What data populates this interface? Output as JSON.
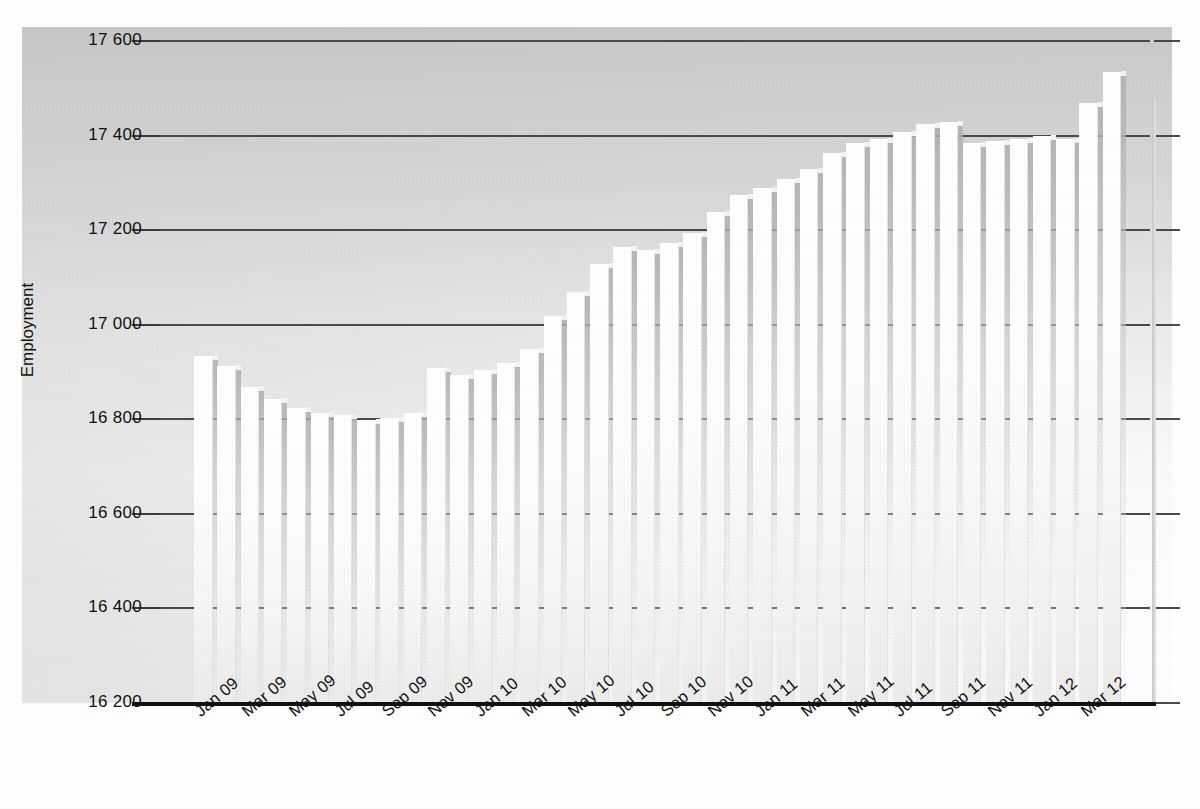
{
  "chart_data": {
    "type": "bar",
    "title": "",
    "subtitle": "",
    "xlabel": "",
    "ylabel": "Employment",
    "ylim": [
      16200,
      17600
    ],
    "ytick_step": 200,
    "ytick_labels": [
      "17 600",
      "17 400",
      "17 200",
      "17 000",
      "16 800",
      "16 600",
      "16 400",
      "16 200"
    ],
    "ytick_values": [
      17600,
      17400,
      17200,
      17000,
      16800,
      16600,
      16400,
      16200
    ],
    "grid": "horizontal",
    "legend": "none",
    "x_tick_labels": [
      "Jan 09",
      "Mar 09",
      "May 09",
      "Jul 09",
      "Sep 09",
      "Nov 09",
      "Jan 10",
      "Mar 10",
      "May 10",
      "Jul 10",
      "Sep 10",
      "Nov 10",
      "Jan 11",
      "Mar 11",
      "May 11",
      "Jul 11",
      "Sep 11",
      "Nov 11",
      "Jan 12",
      "Mar 12"
    ],
    "categories": [
      "Jan 09",
      "Feb 09",
      "Mar 09",
      "Apr 09",
      "May 09",
      "Jun 09",
      "Jul 09",
      "Aug 09",
      "Sep 09",
      "Oct 09",
      "Nov 09",
      "Dec 09",
      "Jan 10",
      "Feb 10",
      "Mar 10",
      "Apr 10",
      "May 10",
      "Jun 10",
      "Jul 10",
      "Aug 10",
      "Sep 10",
      "Oct 10",
      "Nov 10",
      "Dec 10",
      "Jan 11",
      "Feb 11",
      "Mar 11",
      "Apr 11",
      "May 11",
      "Jun 11",
      "Jul 11",
      "Aug 11",
      "Sep 11",
      "Oct 11",
      "Nov 11",
      "Dec 11",
      "Jan 12",
      "Feb 12",
      "Mar 12",
      "Apr 12"
    ],
    "values": [
      16925,
      16905,
      16860,
      16835,
      16815,
      16805,
      16800,
      16790,
      16795,
      16805,
      16900,
      16885,
      16895,
      16910,
      16940,
      17010,
      17060,
      17120,
      17155,
      17150,
      17165,
      17185,
      17230,
      17265,
      17280,
      17300,
      17320,
      17355,
      17375,
      17385,
      17400,
      17415,
      17420,
      17375,
      17380,
      17385,
      17390,
      17385,
      17460,
      17525
    ]
  },
  "axis": {
    "y_axis_title": "Employment"
  }
}
